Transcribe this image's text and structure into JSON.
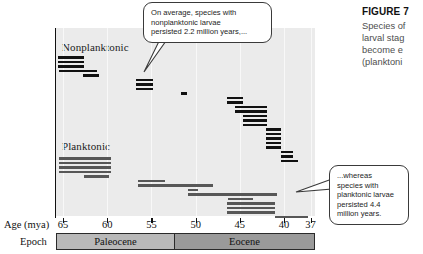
{
  "figure": {
    "title": "FIGURE 7",
    "caption_lines": [
      "Species of",
      "larval stag",
      "become e",
      "(planktoni"
    ]
  },
  "callouts": {
    "top": [
      "On average, species with",
      "nonplanktonic larvae",
      "persisted 2.2 million years,..."
    ],
    "bottom": [
      "...whereas",
      "species with",
      "planktonic larvae",
      "persisted 4.4",
      "million years."
    ]
  },
  "axis": {
    "age_title": "Age (mya)",
    "epoch_title": "Epoch",
    "ticks": [
      "65",
      "60",
      "55",
      "50",
      "45",
      "40",
      "37"
    ],
    "tick_values": [
      65,
      60,
      55,
      50,
      45,
      40,
      37
    ]
  },
  "epochs": [
    {
      "name": "Paleocene",
      "start": 65,
      "end": 50
    },
    {
      "name": "Eocene",
      "start": 50,
      "end": 37
    }
  ],
  "groups": {
    "nonplanktonic_label": "Nonplanktonic",
    "planktonic_label": "Planktonic"
  },
  "chart_data": {
    "type": "bar",
    "title": "FIGURE 7",
    "xlabel": "Age (mya)",
    "ylabel": "",
    "xlim": [
      65.8,
      36.5
    ],
    "grid": true,
    "legend": "none",
    "note": "Horizontal range (Gantt-style) bars: each bar is one species' stratigraphic duration in millions of years ago.",
    "series": [
      {
        "name": "Nonplanktonic",
        "color": "#111111",
        "mean_duration_myr": 2.2,
        "ranges": [
          [
            65.6,
            62.6
          ],
          [
            65.6,
            62.6
          ],
          [
            65.6,
            62.6
          ],
          [
            65.5,
            61.2
          ],
          [
            62.7,
            60.9
          ],
          [
            56.8,
            54.8
          ],
          [
            56.8,
            54.8
          ],
          [
            56.8,
            54.8
          ],
          [
            51.7,
            51.0
          ],
          [
            46.4,
            44.6
          ],
          [
            46.4,
            44.6
          ],
          [
            45.5,
            41.9
          ],
          [
            45.5,
            41.9
          ],
          [
            44.6,
            41.9
          ],
          [
            44.6,
            41.9
          ],
          [
            44.6,
            41.9
          ],
          [
            42.0,
            40.3
          ],
          [
            42.0,
            40.3
          ],
          [
            42.0,
            40.3
          ],
          [
            42.0,
            40.3
          ],
          [
            42.0,
            40.3
          ],
          [
            40.4,
            39.0
          ],
          [
            40.4,
            39.0
          ],
          [
            40.4,
            38.4
          ]
        ]
      },
      {
        "name": "Planktonic",
        "color": "#575757",
        "mean_duration_myr": 4.4,
        "ranges": [
          [
            65.5,
            59.6
          ],
          [
            65.5,
            59.6
          ],
          [
            65.5,
            59.6
          ],
          [
            65.5,
            59.6
          ],
          [
            62.6,
            59.8
          ],
          [
            56.5,
            53.5
          ],
          [
            56.5,
            48.0
          ],
          [
            50.9,
            49.7
          ],
          [
            50.9,
            40.8
          ],
          [
            46.3,
            43.5
          ],
          [
            46.4,
            41.0
          ],
          [
            46.4,
            41.0
          ],
          [
            46.4,
            41.0
          ],
          [
            41.0,
            37.3
          ]
        ]
      }
    ]
  }
}
